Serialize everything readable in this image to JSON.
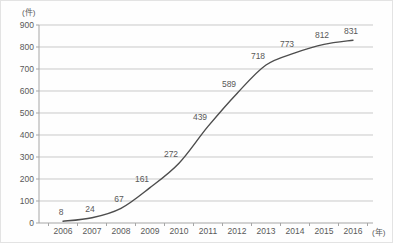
{
  "chart_data": {
    "type": "line",
    "title": "",
    "unit_y": "(件)",
    "unit_x": "(年)",
    "categories": [
      "2006",
      "2007",
      "2008",
      "2009",
      "2010",
      "2011",
      "2012",
      "2013",
      "2014",
      "2015",
      "2016"
    ],
    "values": [
      8,
      24,
      67,
      161,
      272,
      439,
      589,
      718,
      773,
      812,
      831
    ],
    "ylim": [
      0,
      900
    ],
    "ytick_step": 100,
    "yticks": [
      "0",
      "100",
      "200",
      "300",
      "400",
      "500",
      "600",
      "700",
      "800",
      "900"
    ],
    "grid": true,
    "legend": "none",
    "colors": {
      "line": "#4d4d4d",
      "grid": "#c9c9c9",
      "axis": "#a6a6a6",
      "text": "#595959"
    }
  }
}
